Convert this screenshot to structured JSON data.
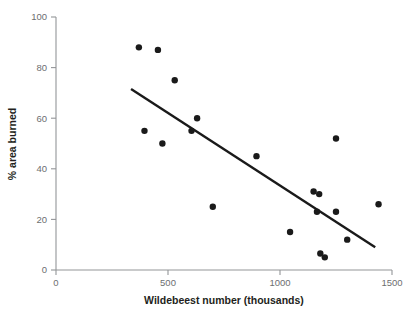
{
  "chart_data": {
    "type": "scatter",
    "title": "",
    "xlabel": "Wildebeest number (thousands)",
    "ylabel": "% area burned",
    "xlim": [
      0,
      1500
    ],
    "ylim": [
      0,
      100
    ],
    "xticks": [
      0,
      500,
      1000,
      1500
    ],
    "yticks": [
      0,
      20,
      40,
      60,
      80,
      100
    ],
    "xtick_labels": [
      "0",
      "500",
      "1000",
      "1500"
    ],
    "ytick_labels": [
      "0",
      "20",
      "40",
      "60",
      "80",
      "100"
    ],
    "grid": false,
    "legend": null,
    "series": [
      {
        "name": "Observations",
        "marker": "filled-circle",
        "color": "#1a1a1a",
        "points": [
          {
            "x": 370,
            "y": 88
          },
          {
            "x": 455,
            "y": 87
          },
          {
            "x": 530,
            "y": 75
          },
          {
            "x": 630,
            "y": 60
          },
          {
            "x": 395,
            "y": 55
          },
          {
            "x": 605,
            "y": 55
          },
          {
            "x": 475,
            "y": 50
          },
          {
            "x": 1250,
            "y": 52
          },
          {
            "x": 895,
            "y": 45
          },
          {
            "x": 1150,
            "y": 31
          },
          {
            "x": 1175,
            "y": 30
          },
          {
            "x": 1440,
            "y": 26
          },
          {
            "x": 700,
            "y": 25
          },
          {
            "x": 1165,
            "y": 23
          },
          {
            "x": 1250,
            "y": 23
          },
          {
            "x": 1045,
            "y": 15
          },
          {
            "x": 1300,
            "y": 12
          },
          {
            "x": 1180,
            "y": 6.5
          },
          {
            "x": 1200,
            "y": 5
          }
        ]
      }
    ],
    "trend_line": {
      "name": "Linear fit",
      "color": "#1a1a1a",
      "x_start": 335,
      "y_start": 71.5,
      "x_end": 1425,
      "y_end": 9
    }
  },
  "axes": {
    "x_axis_label": "Wildebeest number (thousands)",
    "y_axis_label": "% area burned"
  }
}
